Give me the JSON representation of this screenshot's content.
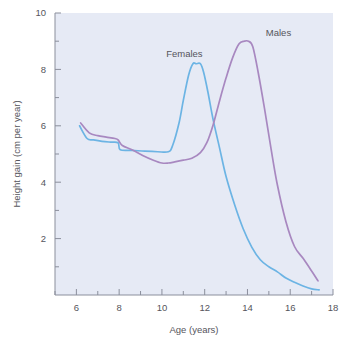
{
  "chart_data": {
    "type": "line",
    "title": "",
    "xlabel": "Age (years)",
    "ylabel": "Height gain (cm per year)",
    "xlim": [
      5,
      18
    ],
    "ylim": [
      0,
      10
    ],
    "xticks": [
      6,
      8,
      10,
      12,
      14,
      16,
      18
    ],
    "xticklabels": [
      "6",
      "8",
      "10",
      "12",
      "14",
      "16",
      "18"
    ],
    "xminorticks": [
      5,
      7,
      9,
      11,
      13,
      15,
      17
    ],
    "yticks": [
      2,
      4,
      6,
      8,
      10
    ],
    "yticklabels": [
      "2",
      "4",
      "6",
      "8",
      "10"
    ],
    "yminorticks": [
      1,
      3,
      5,
      7,
      9
    ],
    "grid": false,
    "legend_position": "inline-annotations",
    "plot_background": "#e6eaf5",
    "figure_background": "#ffffff",
    "series": [
      {
        "name": "Females",
        "color": "#6cb4e4",
        "label_text": "Females",
        "label_x": 11.05,
        "label_y": 8.45,
        "x": [
          6.15,
          6.5,
          6.8,
          7.2,
          7.6,
          7.95,
          8.05,
          8.6,
          9.2,
          9.8,
          10.3,
          10.5,
          10.8,
          11.0,
          11.25,
          11.45,
          11.6,
          11.8,
          11.95,
          12.15,
          12.4,
          12.7,
          13.0,
          13.4,
          13.8,
          14.2,
          14.6,
          15.0,
          15.4,
          15.8,
          16.2,
          16.6,
          17.0,
          17.35
        ],
        "y": [
          6.0,
          5.55,
          5.5,
          5.45,
          5.42,
          5.4,
          5.15,
          5.13,
          5.1,
          5.08,
          5.08,
          5.3,
          6.1,
          6.9,
          7.8,
          8.2,
          8.2,
          8.2,
          7.9,
          7.2,
          6.2,
          5.2,
          4.2,
          3.2,
          2.35,
          1.7,
          1.25,
          1.0,
          0.82,
          0.6,
          0.45,
          0.32,
          0.22,
          0.18
        ]
      },
      {
        "name": "Males",
        "color": "#a888c0",
        "label_text": "Males",
        "label_x": 15.45,
        "label_y": 9.2,
        "x": [
          6.2,
          6.6,
          7.0,
          7.4,
          7.8,
          7.95,
          8.15,
          8.6,
          9.1,
          9.6,
          10.0,
          10.3,
          10.6,
          11.0,
          11.4,
          11.8,
          12.1,
          12.4,
          12.7,
          13.0,
          13.3,
          13.6,
          13.85,
          14.05,
          14.25,
          14.5,
          14.8,
          15.1,
          15.4,
          15.8,
          16.2,
          16.6,
          17.0,
          17.3
        ],
        "y": [
          6.1,
          5.75,
          5.65,
          5.6,
          5.55,
          5.5,
          5.3,
          5.15,
          4.95,
          4.78,
          4.68,
          4.68,
          4.72,
          4.78,
          4.85,
          5.05,
          5.4,
          6.05,
          6.9,
          7.7,
          8.4,
          8.9,
          9.0,
          9.0,
          8.8,
          7.9,
          6.6,
          5.2,
          3.9,
          2.6,
          1.72,
          1.3,
          0.85,
          0.5
        ]
      }
    ]
  }
}
